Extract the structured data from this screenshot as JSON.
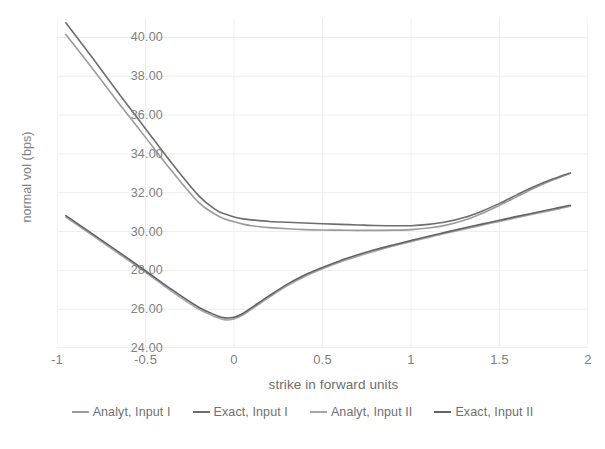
{
  "chart_data": {
    "type": "line",
    "title": "",
    "xlabel": "strike in forward units",
    "ylabel": "normal vol (bps)",
    "xlim": [
      -1,
      2
    ],
    "ylim": [
      24,
      41
    ],
    "xticks": [
      "-1",
      "-0.5",
      "0",
      "0.5",
      "1",
      "1.5",
      "2"
    ],
    "xtick_values": [
      -1,
      -0.5,
      0,
      0.5,
      1,
      1.5,
      2
    ],
    "yticks": [
      "24.00",
      "26.00",
      "28.00",
      "30.00",
      "32.00",
      "34.00",
      "36.00",
      "38.00",
      "40.00"
    ],
    "ytick_values": [
      24,
      26,
      28,
      30,
      32,
      34,
      36,
      38,
      40
    ],
    "grid": true,
    "legend_position": "bottom",
    "x": [
      -0.95,
      -0.8,
      -0.65,
      -0.5,
      -0.35,
      -0.2,
      -0.1,
      -0.05,
      0,
      0.05,
      0.1,
      0.2,
      0.3,
      0.4,
      0.5,
      0.6,
      0.7,
      0.8,
      0.9,
      1.0,
      1.1,
      1.2,
      1.3,
      1.4,
      1.5,
      1.6,
      1.7,
      1.8,
      1.9
    ],
    "series": [
      {
        "name": "Analyt, Input I",
        "color": "#9b9b9b",
        "values": [
          40.15,
          38.4,
          36.6,
          34.85,
          33.1,
          31.5,
          30.85,
          30.65,
          30.5,
          30.38,
          30.3,
          30.2,
          30.14,
          30.1,
          30.08,
          30.07,
          30.06,
          30.06,
          30.07,
          30.1,
          30.18,
          30.33,
          30.58,
          30.93,
          31.35,
          31.8,
          32.25,
          32.65,
          33.0
        ]
      },
      {
        "name": "Exact, Input I",
        "color": "#6d6d6d",
        "values": [
          40.75,
          38.95,
          37.1,
          35.3,
          33.5,
          31.85,
          31.1,
          30.9,
          30.75,
          30.65,
          30.6,
          30.52,
          30.48,
          30.44,
          30.4,
          30.37,
          30.34,
          30.31,
          30.3,
          30.3,
          30.37,
          30.5,
          30.72,
          31.05,
          31.45,
          31.9,
          32.33,
          32.7,
          33.02
        ]
      },
      {
        "name": "Analyt, Input II",
        "color": "#a6a6a6",
        "values": [
          30.75,
          29.8,
          28.85,
          27.9,
          26.9,
          26.0,
          25.58,
          25.45,
          25.5,
          25.7,
          26.0,
          26.62,
          27.2,
          27.68,
          28.08,
          28.43,
          28.73,
          29.0,
          29.25,
          29.48,
          29.7,
          29.92,
          30.12,
          30.33,
          30.52,
          30.72,
          30.92,
          31.1,
          31.3
        ]
      },
      {
        "name": "Exact, Input II",
        "color": "#636363",
        "values": [
          30.82,
          29.88,
          28.94,
          27.98,
          27.0,
          26.1,
          25.68,
          25.55,
          25.58,
          25.78,
          26.08,
          26.7,
          27.28,
          27.76,
          28.15,
          28.5,
          28.8,
          29.07,
          29.31,
          29.54,
          29.76,
          29.97,
          30.18,
          30.38,
          30.58,
          30.78,
          30.97,
          31.16,
          31.35
        ]
      }
    ]
  },
  "style": {
    "grid_color": "#eeeeee",
    "axis_color": "#d9d9d9",
    "text_color": "#7f7f7f",
    "background": "#ffffff"
  }
}
